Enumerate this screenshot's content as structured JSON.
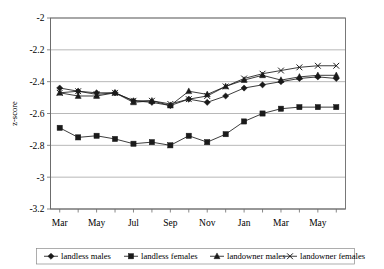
{
  "chart_data": {
    "type": "line",
    "title": "",
    "xlabel": "",
    "ylabel": "z-score",
    "ylim": [
      -3.2,
      -2.0
    ],
    "yticks": [
      "-2",
      "-2.2",
      "-2.4",
      "-2.6",
      "-2.8",
      "-3",
      "-3.2"
    ],
    "ytick_values": [
      -2,
      -2.2,
      -2.4,
      -2.6,
      -2.8,
      -3,
      -3.2
    ],
    "grid": true,
    "legend_position": "bottom",
    "x": [
      "Mar",
      "Apr",
      "May",
      "Jun",
      "Jul",
      "Aug",
      "Sep",
      "Oct",
      "Nov",
      "Dec",
      "Jan",
      "Feb",
      "Mar",
      "Apr",
      "May",
      "Jun"
    ],
    "xtick_labels": [
      "Mar",
      "",
      "May",
      "",
      "Jul",
      "",
      "Sep",
      "",
      "Nov",
      "",
      "Jan",
      "",
      "Mar",
      "",
      "May",
      ""
    ],
    "xticks_visible": [
      "Mar",
      "May",
      "Jul",
      "Sep",
      "Nov",
      "Jan",
      "Mar",
      "May"
    ],
    "series": [
      {
        "name": "landless males",
        "marker": "diamond",
        "values": [
          -2.44,
          -2.46,
          -2.47,
          -2.47,
          -2.52,
          -2.53,
          -2.55,
          -2.51,
          -2.53,
          -2.49,
          -2.44,
          -2.42,
          -2.4,
          -2.38,
          -2.37,
          -2.38
        ]
      },
      {
        "name": "landless females",
        "marker": "square",
        "values": [
          -2.69,
          -2.75,
          -2.74,
          -2.76,
          -2.79,
          -2.78,
          -2.8,
          -2.74,
          -2.78,
          -2.73,
          -2.65,
          -2.6,
          -2.57,
          -2.56,
          -2.56,
          -2.56
        ]
      },
      {
        "name": "landowner males",
        "marker": "triangle",
        "values": [
          -2.47,
          -2.49,
          -2.49,
          -2.47,
          -2.53,
          -2.52,
          -2.55,
          -2.46,
          -2.48,
          -2.43,
          -2.39,
          -2.36,
          -2.39,
          -2.37,
          -2.36,
          -2.36
        ]
      },
      {
        "name": "landowner females",
        "marker": "x",
        "values": [
          -2.47,
          -2.46,
          -2.48,
          -2.47,
          -2.52,
          -2.52,
          -2.54,
          -2.51,
          -2.49,
          -2.43,
          -2.38,
          -2.35,
          -2.33,
          -2.31,
          -2.3,
          -2.3
        ]
      }
    ]
  },
  "legend": {
    "items": [
      {
        "label": "landless males",
        "marker": "diamond"
      },
      {
        "label": "landless females",
        "marker": "square"
      },
      {
        "label": "landowner males",
        "marker": "triangle"
      },
      {
        "label": "landowner females",
        "marker": "x"
      }
    ]
  }
}
